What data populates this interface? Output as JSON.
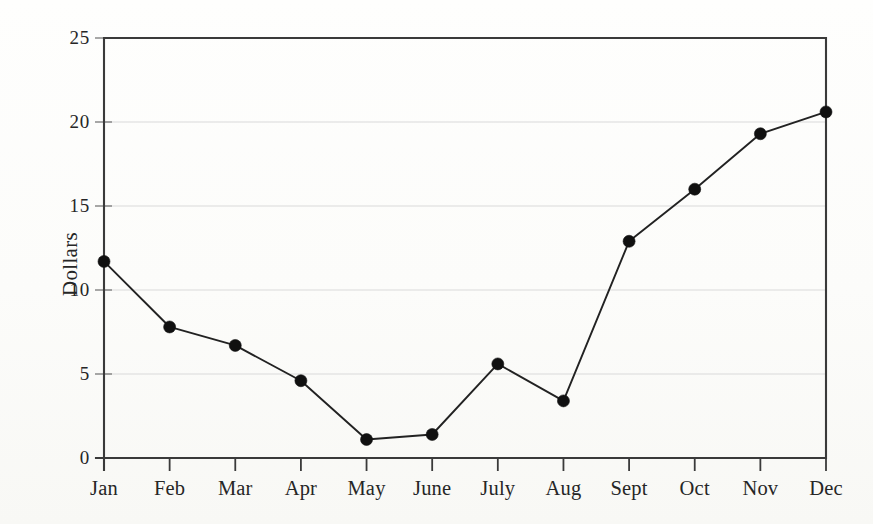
{
  "chart_data": {
    "type": "line",
    "title": "",
    "subtitle": "",
    "xlabel": "",
    "ylabel": "Dollars",
    "categories": [
      "Jan",
      "Feb",
      "Mar",
      "Apr",
      "May",
      "June",
      "July",
      "Aug",
      "Sept",
      "Oct",
      "Nov",
      "Dec"
    ],
    "values": [
      11.7,
      7.8,
      6.7,
      4.6,
      1.1,
      1.4,
      5.6,
      3.4,
      12.9,
      16.0,
      19.3,
      20.6
    ],
    "series": [
      {
        "name": "Dollars",
        "values": [
          11.7,
          7.8,
          6.7,
          4.6,
          1.1,
          1.4,
          5.6,
          3.4,
          12.9,
          16.0,
          19.3,
          20.6
        ]
      }
    ],
    "ylim": [
      0,
      25
    ],
    "ytick_values": [
      0,
      5,
      10,
      15,
      20,
      25
    ],
    "ytick_labels": [
      "0",
      "5",
      "10",
      "15",
      "20",
      "25"
    ],
    "grid": true,
    "grid_axis": "y",
    "legend": false,
    "legend_position": "none",
    "marker": "filled-circle",
    "line_color": "#222222",
    "marker_color": "#101010",
    "grid_color": "#d9d9d9",
    "axis_color": "#3a3a3a",
    "background_color": "#fdfdfb"
  }
}
